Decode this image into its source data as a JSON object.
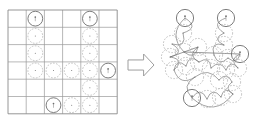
{
  "figure": {
    "background_color": "#ffffff"
  },
  "colors": {
    "grid_line": "#9a9a9a",
    "grid_border": "#8a8a8a",
    "node_dashed_stroke": "#b5b5b5",
    "node_solid_stroke": "#6e6e6e",
    "marker_fill": "#6e6e6e",
    "arrow_stroke": "#9e9e9e",
    "edge_stroke": "#7c7c7c"
  },
  "grid_panel": {
    "name": "grid-panel",
    "columns": 6,
    "rows": 6,
    "origin_x": 8,
    "origin_y": 10,
    "cell_width": 18.2,
    "cell_height": 17.3,
    "node_radius": 7.4,
    "nodes": [
      {
        "id": "g1",
        "col": 1,
        "row": 0,
        "type": "anchor",
        "marker": "dot"
      },
      {
        "id": "g2",
        "col": 1,
        "row": 1,
        "type": "plain"
      },
      {
        "id": "g3",
        "col": 1,
        "row": 2,
        "type": "plain"
      },
      {
        "id": "g4",
        "col": 1,
        "row": 3,
        "type": "plain"
      },
      {
        "id": "g5",
        "col": 4,
        "row": 0,
        "type": "anchor",
        "marker": "dot"
      },
      {
        "id": "g6",
        "col": 4,
        "row": 1,
        "type": "plain"
      },
      {
        "id": "g7",
        "col": 4,
        "row": 2,
        "type": "plain"
      },
      {
        "id": "g8",
        "col": 4,
        "row": 3,
        "type": "plain"
      },
      {
        "id": "g9",
        "col": 4,
        "row": 4,
        "type": "plain"
      },
      {
        "id": "g10",
        "col": 4,
        "row": 5,
        "type": "plain"
      },
      {
        "id": "g11",
        "col": 2,
        "row": 3,
        "type": "plain"
      },
      {
        "id": "g12",
        "col": 3,
        "row": 3,
        "type": "plain"
      },
      {
        "id": "g13",
        "col": 5,
        "row": 3,
        "type": "anchor",
        "marker": "dot"
      },
      {
        "id": "g14",
        "col": 2,
        "row": 5,
        "type": "anchor",
        "marker": "dot"
      },
      {
        "id": "g15",
        "col": 3,
        "row": 5,
        "type": "plain"
      }
    ]
  },
  "arrow": {
    "name": "transform-arrow",
    "direction": "right",
    "x": 128,
    "y": 54,
    "width": 26,
    "height": 22
  },
  "graph_panel": {
    "name": "graph-panel",
    "node_radius": 8.6,
    "nodes": [
      {
        "id": "n1",
        "x": 185,
        "y": 18,
        "type": "anchor",
        "marker": "dot"
      },
      {
        "id": "n2",
        "x": 183,
        "y": 33,
        "type": "plain"
      },
      {
        "id": "n3",
        "x": 172,
        "y": 44,
        "type": "plain"
      },
      {
        "id": "n4",
        "x": 170,
        "y": 57,
        "type": "plain"
      },
      {
        "id": "n5",
        "x": 184,
        "y": 52,
        "type": "plain"
      },
      {
        "id": "n6",
        "x": 198,
        "y": 47,
        "type": "plain"
      },
      {
        "id": "n7",
        "x": 226,
        "y": 18,
        "type": "anchor",
        "marker": "dot"
      },
      {
        "id": "n8",
        "x": 224,
        "y": 33,
        "type": "plain"
      },
      {
        "id": "n9",
        "x": 224,
        "y": 45,
        "type": "plain"
      },
      {
        "id": "n10",
        "x": 214,
        "y": 55,
        "type": "plain"
      },
      {
        "id": "n11",
        "x": 228,
        "y": 58,
        "type": "plain"
      },
      {
        "id": "n12",
        "x": 240,
        "y": 54,
        "type": "anchor",
        "marker": "dot"
      },
      {
        "id": "n13",
        "x": 199,
        "y": 62,
        "type": "plain"
      },
      {
        "id": "n14",
        "x": 186,
        "y": 66,
        "type": "plain"
      },
      {
        "id": "n15",
        "x": 174,
        "y": 70,
        "type": "plain"
      },
      {
        "id": "n16",
        "x": 211,
        "y": 68,
        "type": "plain"
      },
      {
        "id": "n17",
        "x": 226,
        "y": 70,
        "type": "plain"
      },
      {
        "id": "n18",
        "x": 238,
        "y": 68,
        "type": "plain"
      },
      {
        "id": "n19",
        "x": 195,
        "y": 77,
        "type": "plain"
      },
      {
        "id": "n20",
        "x": 219,
        "y": 80,
        "type": "plain"
      },
      {
        "id": "n21",
        "x": 232,
        "y": 82,
        "type": "plain"
      },
      {
        "id": "n22",
        "x": 192,
        "y": 98,
        "type": "anchor",
        "marker": "dot"
      },
      {
        "id": "n23",
        "x": 207,
        "y": 99,
        "type": "plain"
      },
      {
        "id": "n24",
        "x": 221,
        "y": 97,
        "type": "plain"
      },
      {
        "id": "n25",
        "x": 233,
        "y": 94,
        "type": "plain"
      }
    ],
    "edges": [
      {
        "from": "n1",
        "to": "n2",
        "curve": -16
      },
      {
        "from": "n2",
        "to": "n3",
        "curve": -14
      },
      {
        "from": "n3",
        "to": "n4",
        "curve": -15
      },
      {
        "from": "n4",
        "to": "n15",
        "curve": -14
      },
      {
        "from": "n1",
        "to": "n5",
        "curve": 17
      },
      {
        "from": "n5",
        "to": "n6",
        "curve": 12
      },
      {
        "from": "n6",
        "to": "n13",
        "curve": 12
      },
      {
        "from": "n7",
        "to": "n8",
        "curve": 15
      },
      {
        "from": "n8",
        "to": "n9",
        "curve": 13
      },
      {
        "from": "n9",
        "to": "n10",
        "curve": 13
      },
      {
        "from": "n10",
        "to": "n11",
        "curve": 11
      },
      {
        "from": "n11",
        "to": "n12",
        "curve": 10
      },
      {
        "from": "n12",
        "to": "n18",
        "curve": 11
      },
      {
        "from": "n13",
        "to": "n14",
        "curve": 11
      },
      {
        "from": "n14",
        "to": "n15",
        "curve": 11
      },
      {
        "from": "n13",
        "to": "n16",
        "curve": -11
      },
      {
        "from": "n16",
        "to": "n17",
        "curve": -10
      },
      {
        "from": "n17",
        "to": "n18",
        "curve": -10
      },
      {
        "from": "n19",
        "to": "n20",
        "curve": -12
      },
      {
        "from": "n20",
        "to": "n21",
        "curve": -10
      },
      {
        "from": "n22",
        "to": "n23",
        "curve": -13
      },
      {
        "from": "n23",
        "to": "n24",
        "curve": -12
      },
      {
        "from": "n24",
        "to": "n25",
        "curve": -11
      },
      {
        "from": "n22",
        "to": "n25",
        "curve": 22
      },
      {
        "from": "n15",
        "to": "n19",
        "curve": 14
      },
      {
        "from": "n19",
        "to": "n22",
        "curve": 13
      },
      {
        "from": "n21",
        "to": "n25",
        "curve": 9
      },
      {
        "from": "n5",
        "to": "n12",
        "curve": 0
      },
      {
        "from": "n4",
        "to": "n6",
        "curve": 0
      }
    ]
  }
}
